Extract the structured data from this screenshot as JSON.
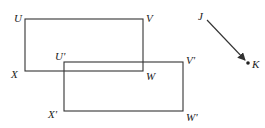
{
  "diagram": {
    "original_rect": {
      "vertices": {
        "U": "U",
        "V": "V",
        "W": "W",
        "X": "X"
      },
      "coords": {
        "x1": 25,
        "y1": 19,
        "x2": 143,
        "y2": 71
      }
    },
    "image_rect": {
      "vertices": {
        "U": "U'",
        "V": "V'",
        "W": "W'",
        "X": "X'"
      },
      "coords": {
        "x1": 64,
        "y1": 62,
        "x2": 183,
        "y2": 111
      }
    },
    "vector": {
      "start_label": "J",
      "end_label": "K",
      "start": [
        207,
        20
      ],
      "end": [
        247,
        62
      ]
    }
  }
}
